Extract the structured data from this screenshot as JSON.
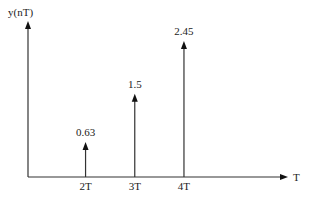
{
  "chart_data": {
    "type": "stem",
    "title": "",
    "xlabel": "T",
    "ylabel": "y(nT)",
    "categories": [
      "2T",
      "3T",
      "4T"
    ],
    "x": [
      2,
      3,
      4
    ],
    "values": [
      0.63,
      1.5,
      2.45
    ],
    "data_labels": [
      "0.63",
      "1.5",
      "2.45"
    ],
    "xlim": [
      0,
      7.3
    ],
    "ylim": [
      0,
      2.8
    ],
    "grid": false,
    "legend": "none"
  }
}
